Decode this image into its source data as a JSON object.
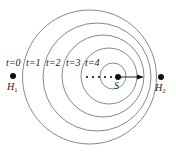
{
  "diagram": {
    "type": "concentric-wavefronts",
    "colors": {
      "circle": "#7a7a7a",
      "ink": "#111111",
      "background": "#ffffff"
    },
    "circles": [
      {
        "label": "t=0",
        "cx": 89.5,
        "cy": 77,
        "r": 67,
        "label_x": 10,
        "label_y": 66
      },
      {
        "label": "t=1",
        "cx": 97,
        "cy": 77,
        "r": 54,
        "label_x": 28,
        "label_y": 66
      },
      {
        "label": "t=2",
        "cx": 103,
        "cy": 76,
        "r": 41,
        "label_x": 48,
        "label_y": 66
      },
      {
        "label": "t=3",
        "cx": 109,
        "cy": 76,
        "r": 28,
        "label_x": 67,
        "label_y": 66
      },
      {
        "label": "t=4",
        "cx": 113,
        "cy": 76,
        "r": 13,
        "label_x": 86,
        "label_y": 66
      }
    ],
    "source": {
      "label": "S",
      "x": 118,
      "y": 77
    },
    "observers": [
      {
        "name": "H",
        "sub": "1",
        "x": 13,
        "y": 76
      },
      {
        "name": "H",
        "sub": "2",
        "x": 161,
        "y": 77
      }
    ],
    "dots_trail": [
      87,
      93,
      99,
      105,
      111
    ],
    "arrow": {
      "from_x": 118,
      "to_x": 143,
      "y": 77
    },
    "labels": {
      "t0": "t=0",
      "t1": "t=1",
      "t2": "t=2",
      "t3": "t=3",
      "t4": "t=4",
      "source": "S",
      "h1_name": "H",
      "h1_sub": "1",
      "h2_name": "H",
      "h2_sub": "2"
    }
  }
}
